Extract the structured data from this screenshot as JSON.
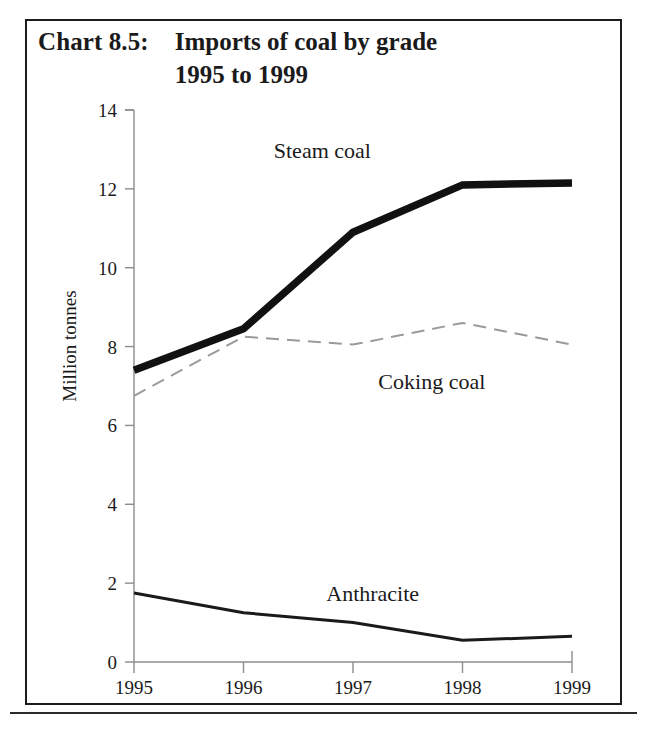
{
  "figure": {
    "chart_label": "Chart 8.5:",
    "title_line1": "Imports of coal by grade",
    "title_line2": "1995 to 1999",
    "border_color": "#1c1c1c",
    "background_color": "#ffffff"
  },
  "chart_data": {
    "type": "line",
    "title": "Chart 8.5:  Imports of coal by grade 1995 to 1999",
    "xlabel": "",
    "ylabel": "Million tonnes",
    "categories": [
      "1995",
      "1996",
      "1997",
      "1998",
      "1999"
    ],
    "x": [
      1995,
      1996,
      1997,
      1998,
      1999
    ],
    "ylim": [
      0,
      14
    ],
    "yticks": [
      0,
      2,
      4,
      6,
      8,
      10,
      12,
      14
    ],
    "ytick_labels": [
      "0",
      "2",
      "4",
      "6",
      "8",
      "10",
      "12",
      "14"
    ],
    "grid": false,
    "legend_position": "inline-labels",
    "series": [
      {
        "name": "Steam coal",
        "values": [
          7.4,
          8.45,
          10.9,
          12.1,
          12.15
        ],
        "color": "#111111",
        "style": "solid",
        "width": 7.5,
        "label_x": 1996.72,
        "label_y": 12.95
      },
      {
        "name": "Coking coal",
        "values": [
          6.75,
          8.25,
          8.05,
          8.6,
          8.05
        ],
        "color": "#9a9a9a",
        "style": "dashed",
        "width": 2.0,
        "label_x": 1997.72,
        "label_y": 7.1
      },
      {
        "name": "Anthracite",
        "values": [
          1.75,
          1.25,
          1.0,
          0.55,
          0.65
        ],
        "color": "#1a1a1a",
        "style": "solid",
        "width": 3.0,
        "label_x": 1997.18,
        "label_y": 1.72
      }
    ]
  },
  "axes": {
    "y_axis_title": "Million tonnes",
    "x_tick_labels": [
      "1995",
      "1996",
      "1997",
      "1998",
      "1999"
    ],
    "y_tick_labels": [
      "14",
      "12",
      "10",
      "8",
      "6",
      "4",
      "2",
      "0"
    ]
  }
}
